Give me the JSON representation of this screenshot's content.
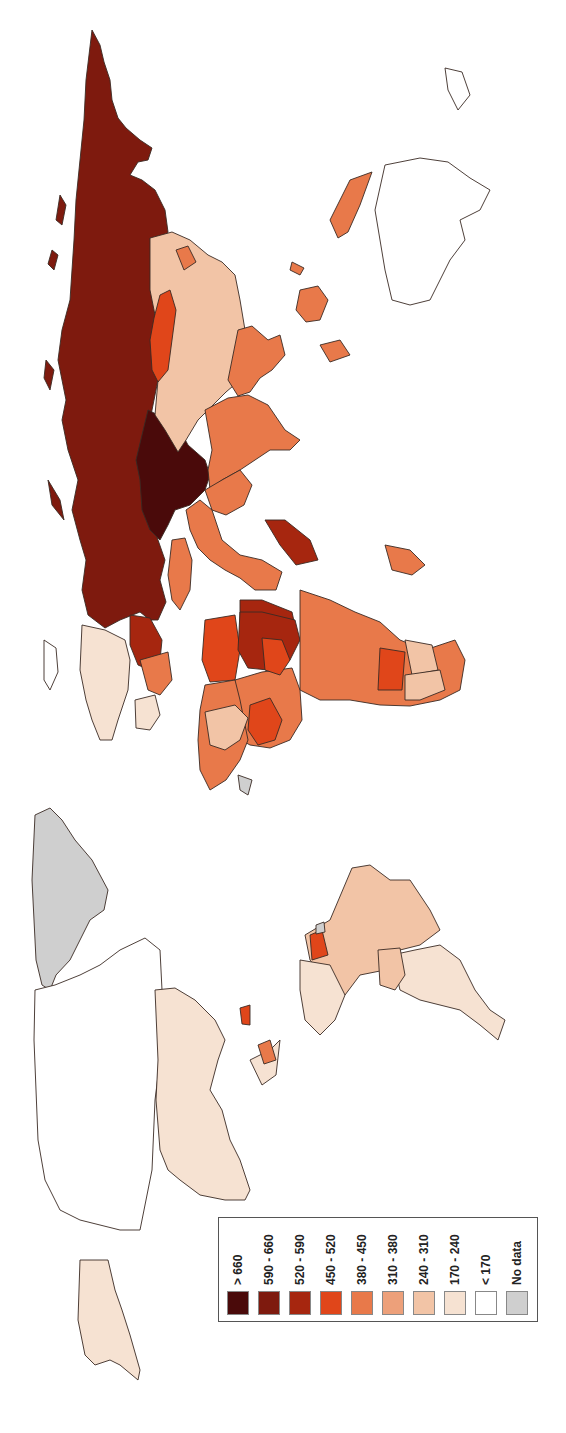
{
  "map": {
    "type": "choropleth",
    "orientation": "rotated 90 degrees (north on left)",
    "background": "#ffffff",
    "border_color": "#3a2a24"
  },
  "legend": {
    "items": [
      {
        "label": "> 660",
        "color": "#4a0a0a"
      },
      {
        "label": "590 - 660",
        "color": "#7e1a0e"
      },
      {
        "label": "520 - 590",
        "color": "#a6260f"
      },
      {
        "label": "450 - 520",
        "color": "#e0461a"
      },
      {
        "label": "380 - 450",
        "color": "#e8794a"
      },
      {
        "label": "310 - 380",
        "color": "#eda07a"
      },
      {
        "label": "240 - 310",
        "color": "#f2c4a6"
      },
      {
        "label": "170 - 240",
        "color": "#f6e2d2"
      },
      {
        "label": "< 170",
        "color": "#ffffff"
      },
      {
        "label": "No data",
        "color": "#cfcfcf"
      }
    ]
  },
  "regions": [
    {
      "name": "Russia",
      "class": "590 - 660"
    },
    {
      "name": "Kazakhstan/Central Asia",
      "class": "> 660"
    },
    {
      "name": "China",
      "class": "240 - 310"
    },
    {
      "name": "Mongolia",
      "class": "450 - 520"
    },
    {
      "name": "India",
      "class": "380 - 450"
    },
    {
      "name": "Southeast Asia",
      "class": "380 - 450"
    },
    {
      "name": "Middle East",
      "class": "380 - 450"
    },
    {
      "name": "Egypt/Libya",
      "class": "520 - 590"
    },
    {
      "name": "West Europe",
      "class": "170 - 240"
    },
    {
      "name": "Scandinavia",
      "class": "170 - 240"
    },
    {
      "name": "Sahara Africa",
      "class": "450 - 520"
    },
    {
      "name": "Central & Southern Africa",
      "class": "380 - 450"
    },
    {
      "name": "Australia",
      "class": "< 170"
    },
    {
      "name": "Greenland",
      "class": "No data"
    },
    {
      "name": "Canada",
      "class": "< 170"
    },
    {
      "name": "United States",
      "class": "170 - 240"
    },
    {
      "name": "Alaska",
      "class": "170 - 240"
    },
    {
      "name": "Brazil",
      "class": "240 - 310"
    },
    {
      "name": "Southern South America",
      "class": "170 - 240"
    }
  ]
}
